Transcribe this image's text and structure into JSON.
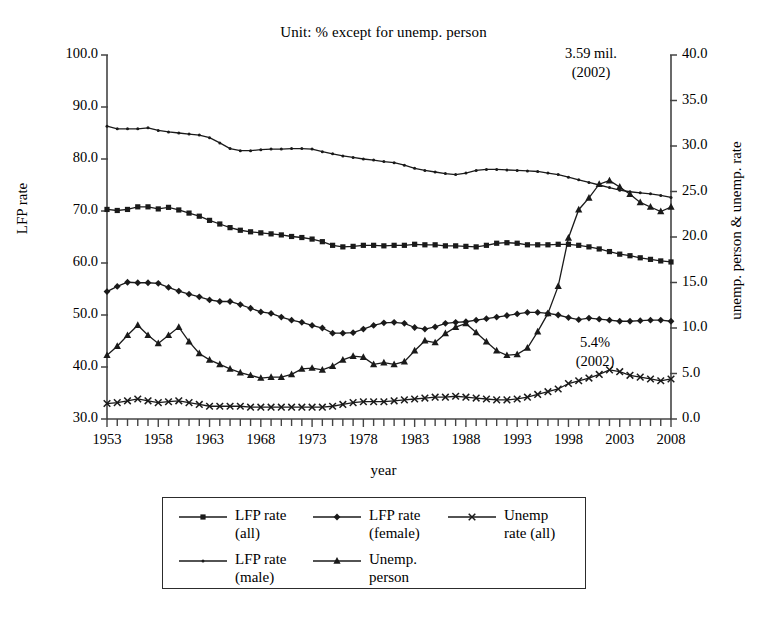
{
  "chart_data": {
    "type": "line",
    "title": "Unit: % except for unemp. person",
    "xlabel": "year",
    "ylabel": "LFP rate",
    "y2label": "unemp. person & unemp. rate",
    "xlim": [
      1953,
      2008
    ],
    "ylim": [
      30.0,
      100.0
    ],
    "y2lim": [
      0.0,
      40.0
    ],
    "grid": false,
    "legend_position": "below-plot",
    "x_tick_labels": [
      "1953",
      "1958",
      "1963",
      "1968",
      "1973",
      "1978",
      "1983",
      "1988",
      "1993",
      "1998",
      "2003",
      "2008"
    ],
    "x_tick_values": [
      1953,
      1958,
      1963,
      1968,
      1973,
      1978,
      1983,
      1988,
      1993,
      1998,
      2003,
      2008
    ],
    "y_tick_labels": [
      "30.0",
      "40.0",
      "50.0",
      "60.0",
      "70.0",
      "80.0",
      "90.0",
      "100.0"
    ],
    "y_tick_values": [
      30.0,
      40.0,
      50.0,
      60.0,
      70.0,
      80.0,
      90.0,
      100.0
    ],
    "y2_tick_labels": [
      "0.0",
      "5.0",
      "10.0",
      "15.0",
      "20.0",
      "25.0",
      "30.0",
      "35.0",
      "40.0"
    ],
    "y2_tick_values": [
      0.0,
      5.0,
      10.0,
      15.0,
      20.0,
      25.0,
      30.0,
      35.0,
      40.0
    ],
    "x": [
      1953,
      1954,
      1955,
      1956,
      1957,
      1958,
      1959,
      1960,
      1961,
      1962,
      1963,
      1964,
      1965,
      1966,
      1967,
      1968,
      1969,
      1970,
      1971,
      1972,
      1973,
      1974,
      1975,
      1976,
      1977,
      1978,
      1979,
      1980,
      1981,
      1982,
      1983,
      1984,
      1985,
      1986,
      1987,
      1988,
      1989,
      1990,
      1991,
      1992,
      1993,
      1994,
      1995,
      1996,
      1997,
      1998,
      1999,
      2000,
      2001,
      2002,
      2003,
      2004,
      2005,
      2006,
      2007,
      2008
    ],
    "series": [
      {
        "name": "LFP rate (all)",
        "marker": "square",
        "axis": "left",
        "values": [
          70.3,
          70.1,
          70.3,
          70.8,
          70.8,
          70.4,
          70.7,
          70.2,
          69.6,
          69.0,
          68.2,
          67.5,
          66.8,
          66.3,
          66.0,
          65.8,
          65.6,
          65.4,
          65.1,
          64.9,
          64.6,
          64.1,
          63.4,
          63.1,
          63.2,
          63.4,
          63.4,
          63.3,
          63.4,
          63.4,
          63.6,
          63.5,
          63.5,
          63.3,
          63.3,
          63.2,
          63.1,
          63.4,
          63.8,
          63.9,
          63.8,
          63.5,
          63.5,
          63.5,
          63.6,
          63.6,
          63.4,
          63.1,
          62.7,
          62.2,
          61.7,
          61.4,
          61.0,
          60.7,
          60.4,
          60.2
        ]
      },
      {
        "name": "LFP rate (male)",
        "marker": "dot",
        "axis": "left",
        "values": [
          86.3,
          85.8,
          85.8,
          85.8,
          86.0,
          85.5,
          85.2,
          85.0,
          84.8,
          84.6,
          84.1,
          83.1,
          82.0,
          81.6,
          81.6,
          81.8,
          81.9,
          81.9,
          82.0,
          82.0,
          81.9,
          81.4,
          81.0,
          80.6,
          80.3,
          80.0,
          79.8,
          79.5,
          79.3,
          78.8,
          78.2,
          77.8,
          77.5,
          77.2,
          77.0,
          77.3,
          77.8,
          78.0,
          78.0,
          77.9,
          77.8,
          77.7,
          77.6,
          77.3,
          77.0,
          76.5,
          76.0,
          75.5,
          75.0,
          74.5,
          74.0,
          73.7,
          73.5,
          73.3,
          73.0,
          72.6
        ]
      },
      {
        "name": "LFP rate (female)",
        "marker": "diamond",
        "axis": "left",
        "values": [
          54.5,
          55.5,
          56.3,
          56.2,
          56.2,
          56.1,
          55.3,
          54.6,
          54.0,
          53.5,
          52.9,
          52.6,
          52.6,
          52.0,
          51.3,
          50.6,
          50.3,
          49.6,
          49.0,
          48.6,
          48.0,
          47.5,
          46.5,
          46.5,
          46.6,
          47.3,
          48.0,
          48.5,
          48.6,
          48.4,
          47.6,
          47.3,
          47.7,
          48.4,
          48.6,
          48.7,
          49.0,
          49.3,
          49.6,
          49.9,
          50.2,
          50.5,
          50.5,
          50.3,
          50.0,
          49.5,
          49.1,
          49.4,
          49.2,
          49.0,
          48.8,
          48.8,
          48.9,
          49.0,
          49.0,
          48.8
        ]
      },
      {
        "name": "Unemp. person",
        "marker": "triangle",
        "axis": "right",
        "unit": "mil.",
        "values": [
          7.0,
          8.0,
          9.2,
          10.3,
          9.2,
          8.3,
          9.2,
          10.1,
          8.5,
          7.2,
          6.5,
          6.0,
          5.5,
          5.1,
          4.8,
          4.5,
          4.6,
          4.6,
          4.9,
          5.5,
          5.6,
          5.4,
          5.8,
          6.5,
          6.9,
          6.8,
          6.0,
          6.2,
          6.0,
          6.3,
          7.5,
          8.6,
          8.4,
          9.4,
          10.1,
          10.5,
          9.5,
          8.5,
          7.5,
          7.0,
          7.1,
          7.8,
          9.6,
          11.6,
          14.6,
          19.9,
          23.0,
          24.3,
          25.8,
          26.2,
          25.5,
          24.7,
          23.8,
          23.3,
          22.8,
          23.3
        ]
      },
      {
        "name": "Unemp rate (all)",
        "marker": "x",
        "axis": "right",
        "values": [
          1.7,
          1.8,
          2.0,
          2.2,
          2.0,
          1.8,
          1.9,
          2.0,
          1.8,
          1.6,
          1.4,
          1.4,
          1.4,
          1.4,
          1.3,
          1.3,
          1.3,
          1.3,
          1.3,
          1.3,
          1.3,
          1.3,
          1.4,
          1.6,
          1.8,
          1.9,
          1.9,
          1.9,
          2.0,
          2.1,
          2.2,
          2.3,
          2.4,
          2.4,
          2.5,
          2.4,
          2.3,
          2.2,
          2.1,
          2.1,
          2.2,
          2.4,
          2.7,
          3.0,
          3.3,
          3.9,
          4.2,
          4.5,
          4.9,
          5.4,
          5.2,
          4.8,
          4.6,
          4.4,
          4.2,
          4.4
        ]
      }
    ],
    "annotations": [
      {
        "id": "unemp-person-peak",
        "text_line1": "3.59 mil.",
        "text_line2": "(2002)",
        "x": 2002,
        "y": 26.2,
        "axis": "right"
      },
      {
        "id": "unemp-rate-peak",
        "text_line1": "5.4%",
        "text_line2": "(2002)",
        "x": 2002,
        "y": 5.4,
        "axis": "right"
      }
    ]
  },
  "legend": {
    "entries": [
      {
        "id": "lfp-all",
        "label": "LFP rate\n(all)",
        "marker": "square"
      },
      {
        "id": "lfp-female",
        "label": "LFP rate\n(female)",
        "marker": "diamond"
      },
      {
        "id": "unemp-rate-all",
        "label": "Unemp\nrate (all)",
        "marker": "x"
      },
      {
        "id": "lfp-male",
        "label": "LFP rate\n(male)",
        "marker": "dot"
      },
      {
        "id": "unemp-person",
        "label": "Unemp.\nperson",
        "marker": "triangle"
      }
    ]
  },
  "colors": {
    "line": "#1a1a1a",
    "axis": "#444444",
    "background": "#ffffff"
  }
}
